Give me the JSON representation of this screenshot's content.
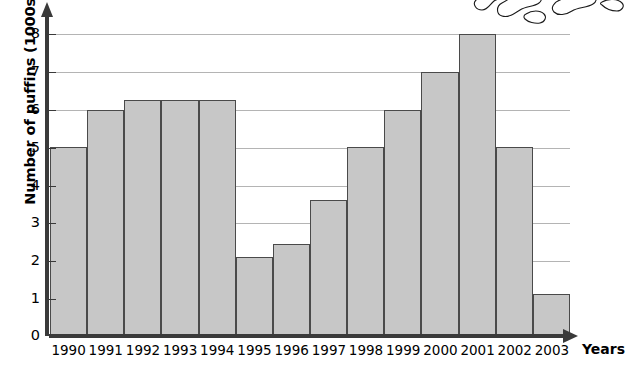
{
  "chart_data": {
    "type": "bar",
    "title": "",
    "subtitle": "",
    "xlabel": "Years",
    "ylabel": "Number of puffins (1000s)",
    "categories": [
      "1990",
      "1991",
      "1992",
      "1993",
      "1994",
      "1995",
      "1996",
      "1997",
      "1998",
      "1999",
      "2000",
      "2001",
      "2002",
      "2003"
    ],
    "values": [
      5.0,
      6.0,
      6.25,
      6.25,
      6.25,
      2.1,
      2.45,
      3.6,
      5.0,
      6.0,
      7.0,
      8.0,
      5.0,
      1.1
    ],
    "series": [
      {
        "name": "Number of puffins (1000s)",
        "values": [
          5.0,
          6.0,
          6.25,
          6.25,
          6.25,
          2.1,
          2.45,
          3.6,
          5.0,
          6.0,
          7.0,
          8.0,
          5.0,
          1.1
        ]
      }
    ],
    "ylim": [
      0,
      8
    ],
    "xlim_categories": 14,
    "ytick_labels": [
      "0",
      "1",
      "2",
      "3",
      "4",
      "5",
      "6",
      "7",
      "8"
    ],
    "ytick_values": [
      0,
      1,
      2,
      3,
      4,
      5,
      6,
      7,
      8
    ],
    "grid": true,
    "grid_axis": "y",
    "legend": false,
    "legend_position": "none",
    "bar_fill_color": "#c7c7c7",
    "bar_border_color": "#4a4a4a",
    "axis_color": "#3a3a3a",
    "grid_color": "#b4b4b4",
    "background_color": "#ffffff",
    "annotations": []
  },
  "decoration": {
    "artwork_name": "puffin-line-drawing",
    "artwork_position": "top-right-cropped"
  }
}
